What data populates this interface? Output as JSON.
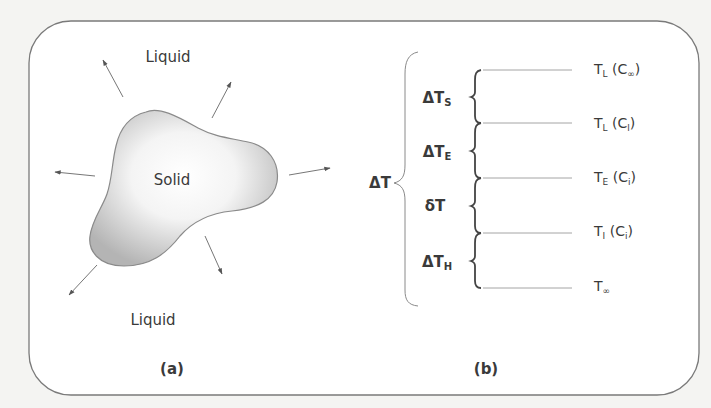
{
  "panel_a": {
    "caption": "(a)",
    "labels": {
      "liquid_top": "Liquid",
      "solid": "Solid",
      "liquid_bottom": "Liquid"
    },
    "arrows": [
      {
        "name": "arrow-upper-left",
        "from": [
          123,
          97
        ],
        "to": [
          103,
          60
        ]
      },
      {
        "name": "arrow-upper-right",
        "from": [
          212,
          118
        ],
        "to": [
          231,
          82
        ]
      },
      {
        "name": "arrow-left",
        "from": [
          95,
          176
        ],
        "to": [
          55,
          172
        ]
      },
      {
        "name": "arrow-right",
        "from": [
          289,
          175
        ],
        "to": [
          330,
          168
        ]
      },
      {
        "name": "arrow-lower-right",
        "from": [
          205,
          236
        ],
        "to": [
          222,
          274
        ]
      },
      {
        "name": "arrow-lower-left",
        "from": [
          97,
          265
        ],
        "to": [
          69,
          295
        ]
      }
    ]
  },
  "panel_b": {
    "caption": "(b)",
    "total_label": {
      "main": "ΔT"
    },
    "intervals": [
      {
        "main": "ΔT",
        "sub": "S"
      },
      {
        "main": "ΔT",
        "sub": "E"
      },
      {
        "main": "δT",
        "sub": ""
      },
      {
        "main": "ΔT",
        "sub": "H"
      }
    ],
    "levels": [
      {
        "main": "T",
        "sub": "L",
        "paren": " (C",
        "psub": "∞",
        "close": ")"
      },
      {
        "main": "T",
        "sub": "L",
        "paren": " (C",
        "psub": "l",
        "close": ")"
      },
      {
        "main": "T",
        "sub": "E",
        "paren": " (C",
        "psub": "i",
        "close": ")"
      },
      {
        "main": "T",
        "sub": "I",
        "paren": " (C",
        "psub": "i",
        "close": ")"
      },
      {
        "main": "T",
        "sub": "∞",
        "paren": "",
        "psub": "",
        "close": ""
      }
    ]
  },
  "colors": {
    "background": "#f4f4f2",
    "frame": "#7a7a7a",
    "blob_edge": "#8a8a8a",
    "blob_fill_light": "#ffffff",
    "blob_fill_dark": "#b8b8b8",
    "line": "#8c8c8c",
    "text": "#3a3a3a"
  }
}
